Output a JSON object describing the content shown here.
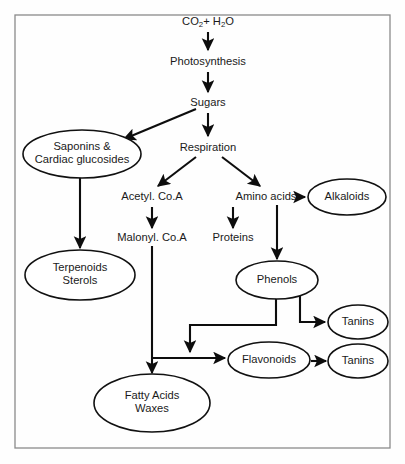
{
  "diagram": {
    "frame": {
      "x": 15,
      "y": 15,
      "width": 375,
      "height": 433
    },
    "colors": {
      "background": "#fefefe",
      "node_fill": "#ffffff",
      "node_stroke": "#111111",
      "edge": "#0d0d0d",
      "text": "#1a1a1a",
      "frame": "#8a8a8a"
    },
    "nodes": [
      {
        "id": "co2-h2o",
        "label": "CO2+ H2O",
        "label_parts": [
          {
            "text": "CO",
            "type": "normal"
          },
          {
            "text": "2",
            "type": "subscript"
          },
          {
            "text": "+ H",
            "type": "normal"
          },
          {
            "text": "2",
            "type": "subscript"
          },
          {
            "text": "O",
            "type": "normal"
          }
        ],
        "shape": "text",
        "cx": 208,
        "cy": 22
      },
      {
        "id": "photosynthesis",
        "label": "Photosynthesis",
        "shape": "text",
        "cx": 208,
        "cy": 62
      },
      {
        "id": "sugars",
        "label": "Sugars",
        "shape": "text",
        "cx": 208,
        "cy": 103
      },
      {
        "id": "respiration",
        "label": "Respiration",
        "shape": "text",
        "cx": 208,
        "cy": 148
      },
      {
        "id": "saponins",
        "label": "Saponins & Cardiac glucosides",
        "lines": [
          "Saponins &",
          "Cardiac glucosides"
        ],
        "shape": "ellipse",
        "cx": 82,
        "cy": 154,
        "rx": 59,
        "ry": 24
      },
      {
        "id": "acetyl-coa",
        "label": "Acetyl. Co.A",
        "shape": "text",
        "cx": 152,
        "cy": 197
      },
      {
        "id": "amino-acids",
        "label": "Amino acids",
        "shape": "text",
        "cx": 266,
        "cy": 197
      },
      {
        "id": "alkaloids",
        "label": "Alkaloids",
        "lines": [
          "Alkaloids"
        ],
        "shape": "ellipse",
        "cx": 347,
        "cy": 197,
        "rx": 39,
        "ry": 18
      },
      {
        "id": "malonyl-coa",
        "label": "Malonyl. Co.A",
        "shape": "text",
        "cx": 152,
        "cy": 238
      },
      {
        "id": "proteins",
        "label": "Proteins",
        "shape": "text",
        "cx": 233,
        "cy": 238
      },
      {
        "id": "terpenoids",
        "label": "Terpenoids Sterols",
        "lines": [
          "Terpenoids",
          "Sterols"
        ],
        "shape": "ellipse",
        "cx": 80,
        "cy": 275,
        "rx": 55,
        "ry": 25
      },
      {
        "id": "phenols",
        "label": "Phenols",
        "lines": [
          "Phenols"
        ],
        "shape": "ellipse",
        "cx": 277,
        "cy": 280,
        "rx": 41,
        "ry": 19
      },
      {
        "id": "tanins-upper",
        "label": "Tanins",
        "lines": [
          "Tanins"
        ],
        "shape": "ellipse",
        "cx": 358,
        "cy": 322,
        "rx": 30,
        "ry": 17
      },
      {
        "id": "flavonoids",
        "label": "Flavonoids",
        "lines": [
          "Flavonoids"
        ],
        "shape": "ellipse",
        "cx": 269,
        "cy": 360,
        "rx": 41,
        "ry": 18
      },
      {
        "id": "tanins-lower",
        "label": "Tanins",
        "lines": [
          "Tanins"
        ],
        "shape": "ellipse",
        "cx": 358,
        "cy": 361,
        "rx": 30,
        "ry": 17
      },
      {
        "id": "fatty-acids",
        "label": "Fatty Acids Waxes",
        "lines": [
          "Fatty Acids",
          "Waxes"
        ],
        "shape": "ellipse",
        "cx": 152,
        "cy": 403,
        "rx": 58,
        "ry": 29
      }
    ],
    "edges": [
      {
        "id": "co2-to-photosynthesis",
        "from": "co2-h2o",
        "to": "photosynthesis",
        "path": "M 208 32 L 208 50",
        "arrow": true
      },
      {
        "id": "photosynthesis-to-sugars",
        "from": "photosynthesis",
        "to": "sugars",
        "path": "M 208 72 L 208 92",
        "arrow": true
      },
      {
        "id": "sugars-to-saponins",
        "from": "sugars",
        "to": "saponins",
        "path": "M 196 109 L 124 139",
        "arrow": true
      },
      {
        "id": "sugars-to-respiration",
        "from": "sugars",
        "to": "respiration",
        "path": "M 208 113 L 208 136",
        "arrow": true
      },
      {
        "id": "respiration-to-acetyl",
        "from": "respiration",
        "to": "acetyl-coa",
        "path": "M 196 157 L 158 186",
        "arrow": true
      },
      {
        "id": "respiration-to-amino",
        "from": "respiration",
        "to": "amino-acids",
        "path": "M 222 157 L 260 186",
        "arrow": true
      },
      {
        "id": "saponins-to-terpenoids",
        "from": "saponins",
        "to": "terpenoids",
        "path": "M 80 178 L 80 248",
        "arrow": true
      },
      {
        "id": "acetyl-to-malonyl",
        "from": "acetyl-coa",
        "to": "malonyl-coa",
        "path": "M 152 207 L 152 228",
        "arrow": true
      },
      {
        "id": "amino-to-alkaloids",
        "from": "amino-acids",
        "to": "alkaloids",
        "path": "M 300 197 L 305 197",
        "arrow": true
      },
      {
        "id": "amino-to-proteins",
        "from": "amino-acids",
        "to": "proteins",
        "path": "M 233 207 L 233 228",
        "arrow": true
      },
      {
        "id": "amino-to-phenols",
        "from": "amino-acids",
        "to": "phenols",
        "path": "M 277 205 L 277 259",
        "arrow": true
      },
      {
        "id": "malonyl-to-junction",
        "from": "malonyl-coa",
        "to": "fatty-acids",
        "path": "M 152 246 L 152 373",
        "arrow": true
      },
      {
        "id": "junction-to-flavonoids",
        "from": "malonyl-coa",
        "to": "flavonoids",
        "path": "M 152 358 L 225 358",
        "arrow": true
      },
      {
        "id": "phenols-to-tanins-upper",
        "from": "phenols",
        "to": "tanins-upper",
        "path": "M 300 295 L 300 322 L 325 322",
        "arrow": true
      },
      {
        "id": "phenols-to-flavonoids",
        "from": "phenols",
        "to": "flavonoids",
        "path": "M 276 297 L 276 325 L 190 325 L 190 352",
        "arrow": true
      },
      {
        "id": "flavonoids-to-tanins-lower",
        "from": "flavonoids",
        "to": "tanins-lower",
        "path": "M 311 361 L 326 361",
        "arrow": true
      }
    ]
  }
}
